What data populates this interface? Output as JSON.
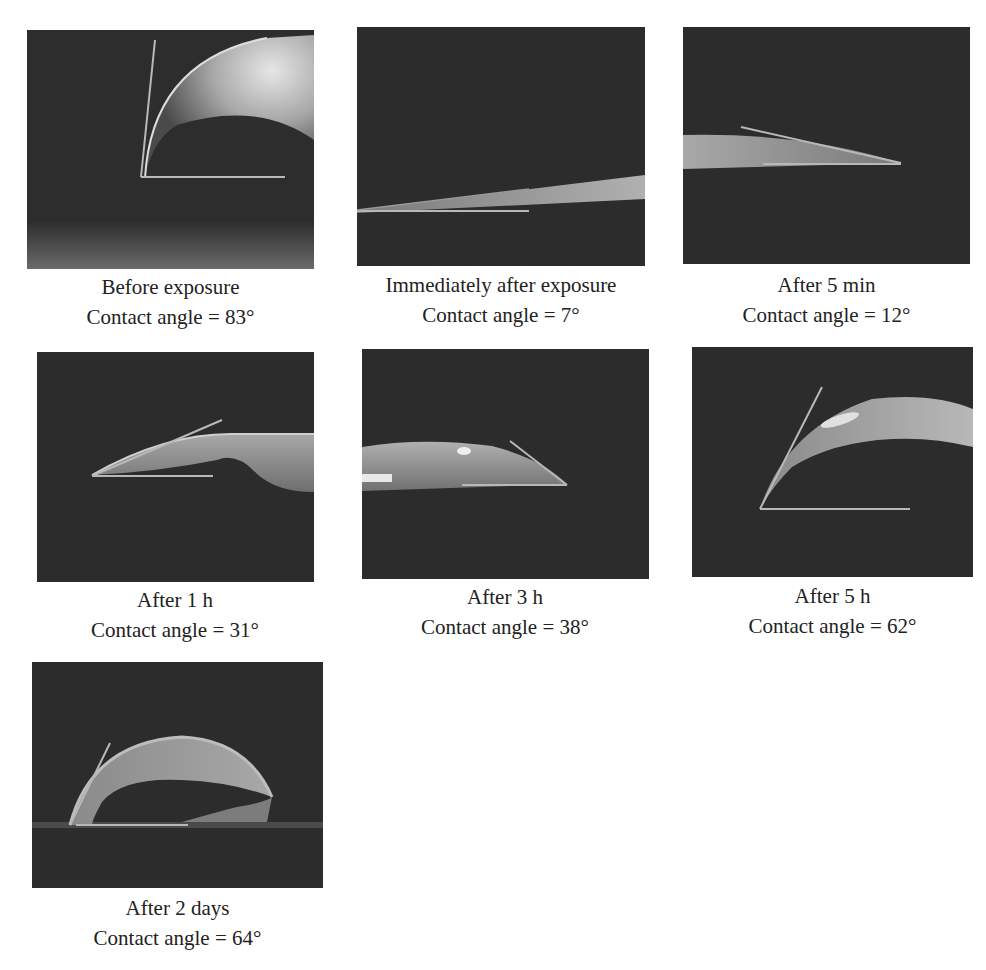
{
  "figure": {
    "panels": [
      {
        "id": "p1",
        "condition": "Before exposure",
        "angle_label": "Contact angle = 83°",
        "contact_angle_deg": 83
      },
      {
        "id": "p2",
        "condition": "Immediately after exposure",
        "angle_label": "Contact angle = 7°",
        "contact_angle_deg": 7
      },
      {
        "id": "p3",
        "condition": "After 5 min",
        "angle_label": "Contact angle = 12°",
        "contact_angle_deg": 12
      },
      {
        "id": "p4",
        "condition": "After 1 h",
        "angle_label": "Contact angle = 31°",
        "contact_angle_deg": 31
      },
      {
        "id": "p5",
        "condition": "After 3 h",
        "angle_label": "Contact angle = 38°",
        "contact_angle_deg": 38
      },
      {
        "id": "p6",
        "condition": "After 5 h",
        "angle_label": "Contact angle = 62°",
        "contact_angle_deg": 62
      },
      {
        "id": "p7",
        "condition": "After 2 days",
        "angle_label": "Contact angle = 64°",
        "contact_angle_deg": 64
      }
    ]
  },
  "colors": {
    "photo_background": "#2b2b2b",
    "droplet": "#9a9a9a",
    "tangent_line": "#b8b8b8",
    "caption_text": "#222222"
  }
}
